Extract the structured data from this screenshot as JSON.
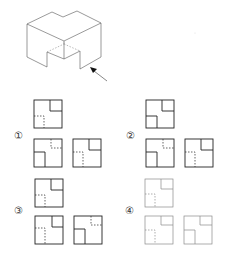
{
  "figure": {
    "arrow_direction": "front-right, pointing up-left",
    "colors": {
      "line": "#333333",
      "hidden_line": "#555555",
      "faded_line": "#9a9a9a"
    }
  },
  "options": [
    {
      "label": "①",
      "number": 1
    },
    {
      "label": "②",
      "number": 2
    },
    {
      "label": "③",
      "number": 3
    },
    {
      "label": "④",
      "number": 4
    }
  ]
}
